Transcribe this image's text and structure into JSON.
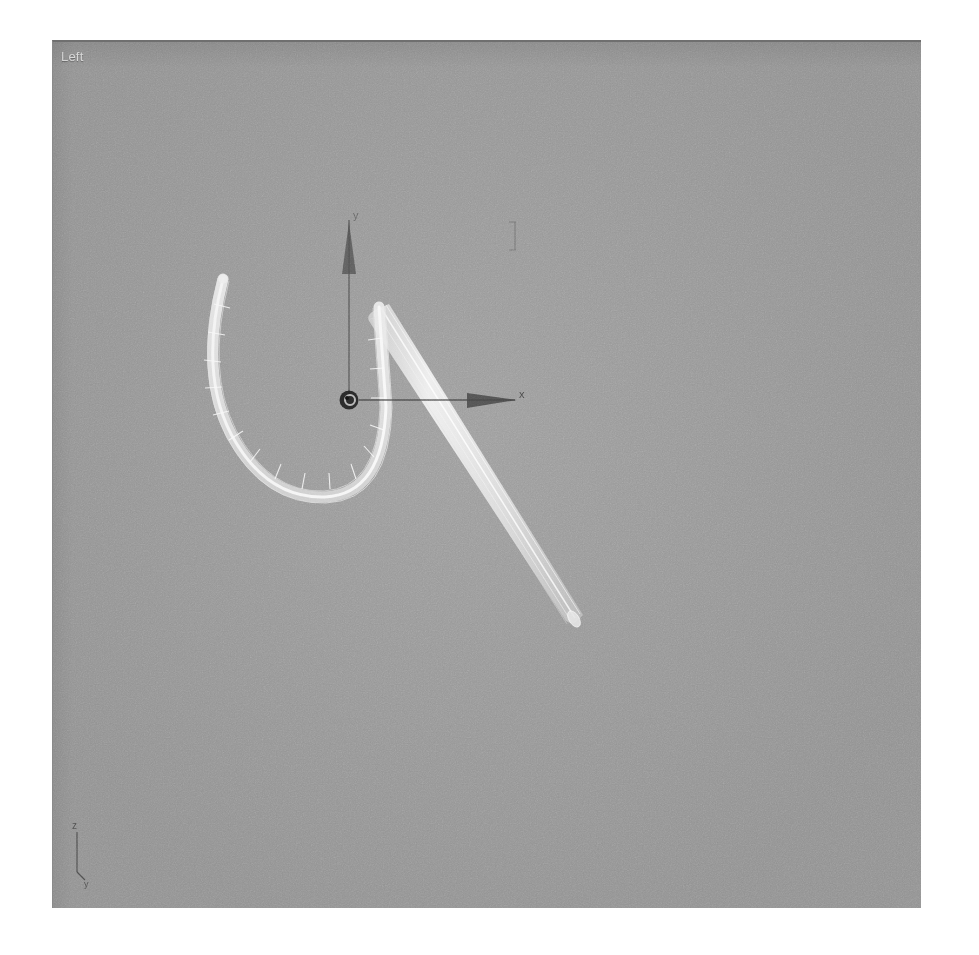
{
  "app": {
    "type": "3d-modeling-viewport",
    "background_color": "#9a9a9a",
    "outer_background_color": "#ffffff"
  },
  "viewport": {
    "label": "Left",
    "label_color": "#e9e9e9",
    "projection": "orthographic",
    "shading": "wireframe",
    "width": 868,
    "height": 866
  },
  "gizmo": {
    "name": "transform-gizmo",
    "origin": {
      "x": 348,
      "y": 398
    },
    "pivot_marker_color": "#151515",
    "axes": [
      {
        "id": "y",
        "label": "y",
        "direction": "up",
        "color": "#4d4d4d",
        "length": 160
      },
      {
        "id": "x",
        "label": "x",
        "direction": "right",
        "color": "#3f3f3f",
        "length": 165
      }
    ]
  },
  "tripod": {
    "name": "view-axis-tripod",
    "labels": [
      {
        "id": "z",
        "text": "z"
      },
      {
        "id": "y",
        "text": "y"
      }
    ],
    "color": "#3a3a3a"
  },
  "objects": [
    {
      "name": "fish-hook-curve",
      "type": "swept-spline-wireframe",
      "color": "#efefef",
      "selected": true,
      "description": "U-shaped hook bend with segment ribs"
    },
    {
      "name": "hook-shaft",
      "type": "swept-spline-wireframe",
      "color": "#e4e4e4",
      "selected": true,
      "description": "Straight tapered shaft running down-right"
    }
  ],
  "markers": [
    {
      "name": "tick-mark",
      "x": 514,
      "y": 228,
      "color": "#5a5a5a"
    }
  ]
}
